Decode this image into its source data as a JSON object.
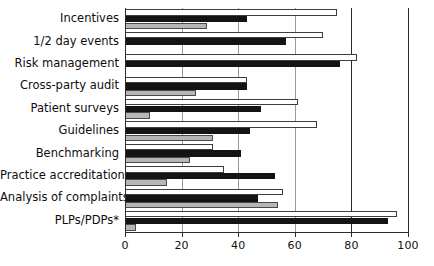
{
  "chart_data": {
    "type": "bar",
    "orientation": "horizontal",
    "title": "",
    "subtitle": "",
    "xlabel": "",
    "ylabel": "",
    "xlim": [
      0,
      100
    ],
    "xticks": [
      0,
      20,
      40,
      60,
      80,
      100
    ],
    "xtick_labels": [
      "0",
      "20",
      "40",
      "60",
      "80",
      "100"
    ],
    "grid": true,
    "grid_axis": "x",
    "legend": null,
    "legend_position": "none",
    "annotations": [
      "*"
    ],
    "categories": [
      "Incentives",
      "1/2 day events",
      "Risk management",
      "Cross-party audit",
      "Patient surveys",
      "Guidelines",
      "Benchmarking",
      "Practice accreditation",
      "Analysis of complaints",
      "PLPs/PDPs*"
    ],
    "series": [
      {
        "name": "series-white",
        "style": "white-filled-outlined",
        "color": "#ffffff",
        "edge_color": "#3d3d3d",
        "values": [
          75,
          70,
          82,
          43,
          61,
          68,
          31,
          35,
          56,
          96
        ]
      },
      {
        "name": "series-black",
        "style": "black-filled",
        "color": "#141414",
        "edge_color": "#141414",
        "values": [
          43,
          57,
          76,
          43,
          48,
          44,
          41,
          53,
          47,
          93
        ]
      },
      {
        "name": "series-gray",
        "style": "gray-filled",
        "color": "#b6b6b6",
        "edge_color": "#4a4a4a",
        "values": [
          29,
          0,
          0,
          25,
          9,
          31,
          23,
          15,
          54,
          4
        ]
      }
    ]
  },
  "axis": {
    "x_axis_name": "x-axis",
    "y_axis_name": "y-axis"
  }
}
